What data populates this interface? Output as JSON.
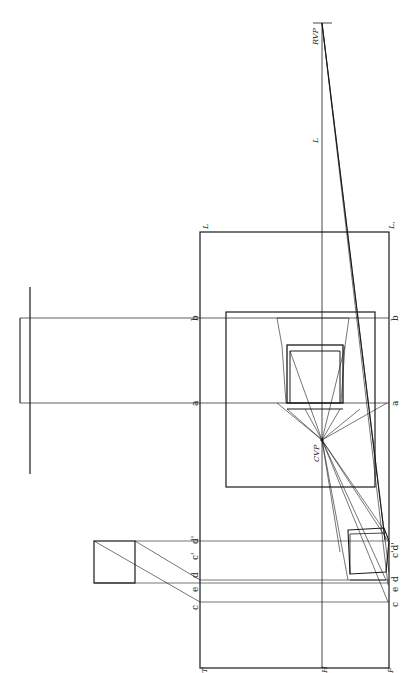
{
  "figure": {
    "colors": {
      "ink": "#1a1a1a",
      "paper": "#ffffff"
    }
  },
  "labels": {
    "rvp": "RVP",
    "cvp": "CVP",
    "l_upper": "L",
    "l_frame_left": "L",
    "l_frame_right": "L,",
    "b_left": "b",
    "b_right": "b",
    "a_left": "a",
    "a_right": "a",
    "c_left": "c",
    "e_left": "e",
    "d_left": "d",
    "cprime_left": "c'",
    "dprime_left": "d'",
    "c_right": "c",
    "e_right": "e",
    "d_right": "d",
    "cdprime_right": "c'd'",
    "t": "T",
    "h": "H",
    "f": "F"
  }
}
